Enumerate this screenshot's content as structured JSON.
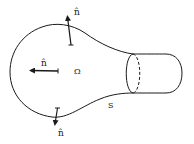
{
  "figure": {
    "region_label": "Ω",
    "surface_label": "S",
    "normal_label": "n̂",
    "normals": [
      {
        "position": "top",
        "label": "n̂"
      },
      {
        "position": "left",
        "label": "n̂"
      },
      {
        "position": "bottom",
        "label": "n̂"
      }
    ],
    "colors": {
      "stroke": "#1a1a1a",
      "background": "#ffffff"
    }
  }
}
